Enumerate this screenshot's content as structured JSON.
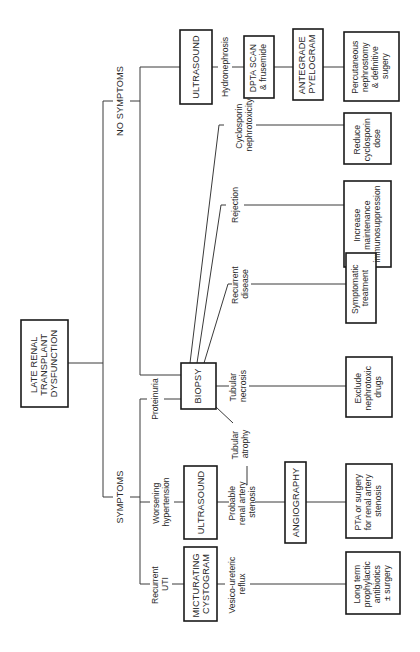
{
  "diagram": {
    "orientation": "rotated 90 degrees counter-clockwise",
    "root": {
      "lines": [
        "LATE RENAL",
        "TRANSPLANT",
        "DYSFUNCTION"
      ]
    },
    "branches": {
      "no_symptoms": "NO SYMPTOMS",
      "symptoms": "SYMPTOMS"
    },
    "no_symptoms_path": {
      "test": "ULTRASOUND",
      "finding": "Hydronephrosis",
      "step2": {
        "lines": [
          "DPTA SCAN",
          "& frusemide"
        ]
      },
      "step3": {
        "lines": [
          "ANTEGRADE",
          "PYELOGRAM"
        ]
      },
      "outcome": {
        "lines": [
          "Percutaneous",
          "nephrostomy",
          "& definitive",
          "sugery"
        ]
      }
    },
    "symptoms_path": {
      "presentations": [
        {
          "lines": [
            "Recurrent",
            "UTI"
          ]
        },
        {
          "lines": [
            "Worsening",
            "hypertension"
          ]
        },
        {
          "lines": [
            "Proteinuria"
          ]
        }
      ],
      "micturating": {
        "lines": [
          "MICTURATING",
          "CYSTOGRAM"
        ]
      },
      "vur_finding": {
        "lines": [
          "Vesico-ureteric",
          "reflux"
        ]
      },
      "vur_outcome": {
        "lines": [
          "Long term",
          "prophylactic",
          "antibiotics",
          "± surgery"
        ]
      },
      "ultrasound": "ULTRASOUND",
      "ras_finding": {
        "lines": [
          "Probable",
          "renal artery",
          "stenosis"
        ]
      },
      "angiography": "ANGIOGRAPHY",
      "ras_outcome": {
        "lines": [
          "PTA or surgery",
          "for renal artery",
          "stenosis"
        ]
      }
    },
    "biopsy": {
      "label": "BIOPSY",
      "findings": [
        {
          "id": "tubular-atrophy",
          "lines": [
            "Tubular",
            "atrophy"
          ]
        },
        {
          "id": "tubular-necrosis",
          "lines": [
            "Tubular",
            "necrosis"
          ]
        },
        {
          "id": "recurrent-disease",
          "lines": [
            "Recurrent",
            "disease"
          ]
        },
        {
          "id": "rejection",
          "lines": [
            "Rejection"
          ]
        },
        {
          "id": "cyclosporin-nephrotoxicity",
          "lines": [
            "Cyclosporin",
            "nephrotoxicity"
          ]
        }
      ],
      "outcomes": [
        {
          "id": "exclude-nephrotoxic",
          "lines": [
            "Exclude",
            "nephrotoxic",
            "drugs"
          ]
        },
        {
          "id": "symptomatic-treatment",
          "lines": [
            "Symptomatic",
            "treatment"
          ]
        },
        {
          "id": "increase-immunosuppression",
          "lines": [
            "Increase",
            "maintenance",
            "immunosuppression"
          ]
        },
        {
          "id": "reduce-cyclosporin",
          "lines": [
            "Reduce",
            "cyclosporin",
            "dose"
          ]
        }
      ]
    }
  }
}
